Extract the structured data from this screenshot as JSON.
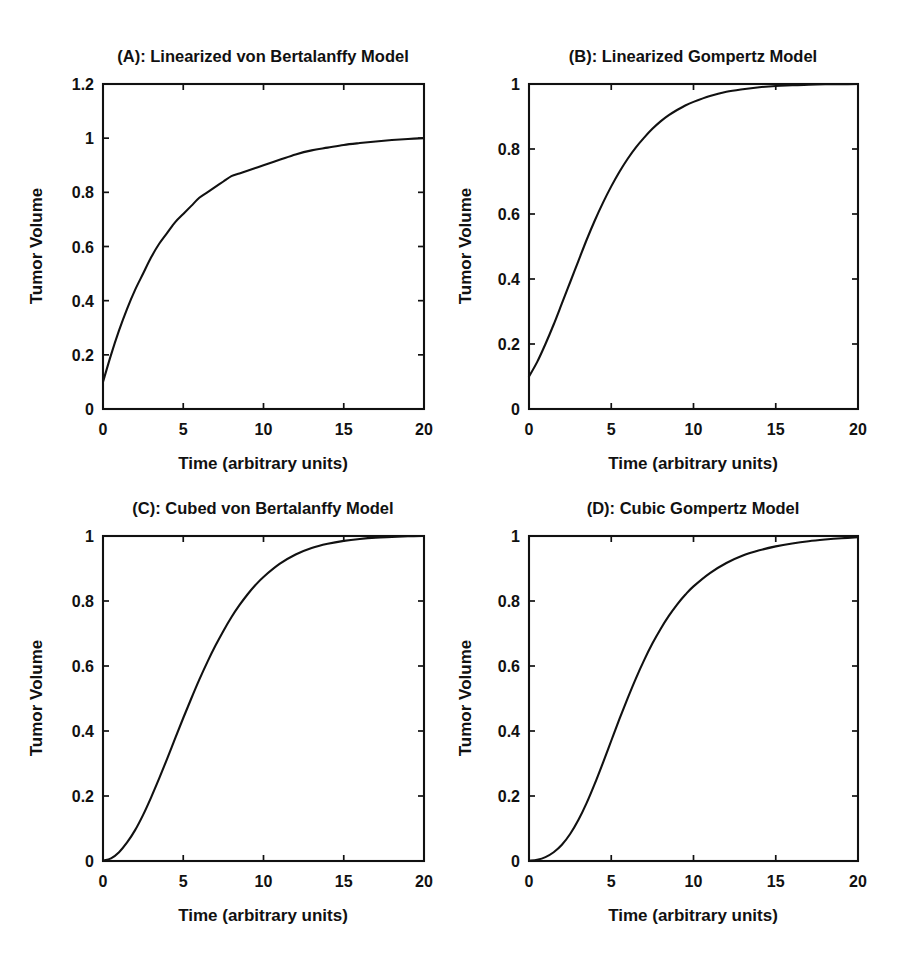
{
  "figure": {
    "background_color": "#ffffff",
    "line_color": "#111111",
    "panel_count": 4
  },
  "panels": {
    "a": {
      "title": "(A): Linearized von Bertalanffy Model",
      "xlabel": "Time (arbitrary units)",
      "ylabel": "Tumor Volume",
      "xticks": [
        "0",
        "5",
        "10",
        "15",
        "20"
      ],
      "yticks": [
        "0",
        "0.2",
        "0.4",
        "0.6",
        "0.8",
        "1",
        "1.2"
      ]
    },
    "b": {
      "title": "(B): Linearized Gompertz Model",
      "xlabel": "Time (arbitrary units)",
      "ylabel": "Tumor Volume",
      "xticks": [
        "0",
        "5",
        "10",
        "15",
        "20"
      ],
      "yticks": [
        "0",
        "0.2",
        "0.4",
        "0.6",
        "0.8",
        "1"
      ]
    },
    "c": {
      "title": "(C): Cubed von Bertalanffy Model",
      "xlabel": "Time (arbitrary units)",
      "ylabel": "Tumor Volume",
      "xticks": [
        "0",
        "5",
        "10",
        "15",
        "20"
      ],
      "yticks": [
        "0",
        "0.2",
        "0.4",
        "0.6",
        "0.8",
        "1"
      ]
    },
    "d": {
      "title": "(D): Cubic Gompertz Model",
      "xlabel": "Time (arbitrary units)",
      "ylabel": "Tumor Volume",
      "xticks": [
        "0",
        "5",
        "10",
        "15",
        "20"
      ],
      "yticks": [
        "0",
        "0.2",
        "0.4",
        "0.6",
        "0.8",
        "1"
      ]
    }
  },
  "chart_data": [
    {
      "id": "a",
      "type": "line",
      "title": "(A): Linearized von Bertalanffy Model",
      "xlabel": "Time (arbitrary units)",
      "ylabel": "Tumor Volume",
      "xlim": [
        0,
        20
      ],
      "ylim": [
        0,
        1.2
      ],
      "xticks": [
        0,
        5,
        10,
        15,
        20
      ],
      "yticks": [
        0,
        0.2,
        0.4,
        0.6,
        0.8,
        1,
        1.2
      ],
      "grid": false,
      "legend": "none",
      "series": [
        {
          "name": "Linearized von Bertalanffy",
          "x": [
            0,
            0.5,
            1,
            1.5,
            2,
            2.5,
            3,
            3.5,
            4,
            4.5,
            5,
            5.5,
            6,
            6.5,
            7,
            7.5,
            8,
            8.5,
            9,
            9.5,
            10,
            11,
            12,
            13,
            14,
            15,
            16,
            17,
            18,
            19,
            20
          ],
          "y": [
            0.1,
            0.2,
            0.29,
            0.37,
            0.44,
            0.5,
            0.56,
            0.61,
            0.65,
            0.69,
            0.72,
            0.75,
            0.78,
            0.8,
            0.82,
            0.84,
            0.86,
            0.87,
            0.88,
            0.89,
            0.9,
            0.92,
            0.94,
            0.955,
            0.965,
            0.975,
            0.982,
            0.988,
            0.993,
            0.997,
            1.0
          ]
        }
      ]
    },
    {
      "id": "b",
      "type": "line",
      "title": "(B): Linearized Gompertz Model",
      "xlabel": "Time (arbitrary units)",
      "ylabel": "Tumor Volume",
      "xlim": [
        0,
        20
      ],
      "ylim": [
        0,
        1
      ],
      "xticks": [
        0,
        5,
        10,
        15,
        20
      ],
      "yticks": [
        0,
        0.2,
        0.4,
        0.6,
        0.8,
        1
      ],
      "grid": false,
      "legend": "none",
      "series": [
        {
          "name": "Linearized Gompertz",
          "x": [
            0,
            0.5,
            1,
            1.5,
            2,
            2.5,
            3,
            3.5,
            4,
            4.5,
            5,
            5.5,
            6,
            6.5,
            7,
            7.5,
            8,
            8.5,
            9,
            9.5,
            10,
            11,
            12,
            13,
            14,
            15,
            16,
            17,
            18,
            19,
            20
          ],
          "y": [
            0.1,
            0.145,
            0.2,
            0.26,
            0.325,
            0.39,
            0.455,
            0.52,
            0.58,
            0.635,
            0.685,
            0.73,
            0.77,
            0.805,
            0.835,
            0.862,
            0.885,
            0.904,
            0.92,
            0.934,
            0.945,
            0.963,
            0.976,
            0.984,
            0.99,
            0.994,
            0.996,
            0.998,
            0.999,
            0.9995,
            1.0
          ]
        }
      ]
    },
    {
      "id": "c",
      "type": "line",
      "title": "(C): Cubed von Bertalanffy Model",
      "xlabel": "Time (arbitrary units)",
      "ylabel": "Tumor Volume",
      "xlim": [
        0,
        20
      ],
      "ylim": [
        0,
        1
      ],
      "xticks": [
        0,
        5,
        10,
        15,
        20
      ],
      "yticks": [
        0,
        0.2,
        0.4,
        0.6,
        0.8,
        1
      ],
      "grid": false,
      "legend": "none",
      "series": [
        {
          "name": "Cubed von Bertalanffy",
          "x": [
            0,
            0.5,
            1,
            1.5,
            2,
            2.5,
            3,
            3.5,
            4,
            4.5,
            5,
            5.5,
            6,
            6.5,
            7,
            7.5,
            8,
            8.5,
            9,
            9.5,
            10,
            11,
            12,
            13,
            14,
            15,
            16,
            17,
            18,
            19,
            20
          ],
          "y": [
            0.001,
            0.008,
            0.027,
            0.057,
            0.095,
            0.142,
            0.196,
            0.254,
            0.315,
            0.378,
            0.44,
            0.5,
            0.558,
            0.612,
            0.662,
            0.708,
            0.75,
            0.787,
            0.82,
            0.849,
            0.874,
            0.914,
            0.943,
            0.963,
            0.976,
            0.985,
            0.991,
            0.995,
            0.997,
            0.999,
            1.0
          ]
        }
      ]
    },
    {
      "id": "d",
      "type": "line",
      "title": "(D): Cubic Gompertz Model",
      "xlabel": "Time (arbitrary units)",
      "ylabel": "Tumor Volume",
      "xlim": [
        0,
        20
      ],
      "ylim": [
        0,
        1
      ],
      "xticks": [
        0,
        5,
        10,
        15,
        20
      ],
      "yticks": [
        0,
        0.2,
        0.4,
        0.6,
        0.8,
        1
      ],
      "grid": false,
      "legend": "none",
      "series": [
        {
          "name": "Cubic Gompertz",
          "x": [
            0,
            0.5,
            1,
            1.5,
            2,
            2.5,
            3,
            3.5,
            4,
            4.5,
            5,
            5.5,
            6,
            6.5,
            7,
            7.5,
            8,
            8.5,
            9,
            9.5,
            10,
            11,
            12,
            13,
            14,
            15,
            16,
            17,
            18,
            19,
            20
          ],
          "y": [
            0.001,
            0.004,
            0.012,
            0.027,
            0.05,
            0.083,
            0.126,
            0.178,
            0.238,
            0.303,
            0.37,
            0.437,
            0.501,
            0.562,
            0.618,
            0.669,
            0.714,
            0.754,
            0.789,
            0.819,
            0.845,
            0.886,
            0.917,
            0.94,
            0.956,
            0.968,
            0.977,
            0.984,
            0.989,
            0.993,
            0.996
          ]
        }
      ]
    }
  ]
}
